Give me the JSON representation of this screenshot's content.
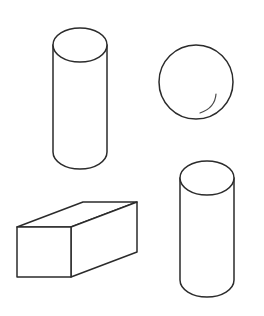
{
  "canvas": {
    "width": 264,
    "height": 316,
    "background_color": "#ffffff",
    "description": "Line drawing of four 3D geometric solids on a plain white background"
  },
  "style": {
    "stroke_color": "#2b2b2b",
    "stroke_width": 1.5,
    "fill_color": "#ffffff",
    "highlight_stroke_color": "#4a4a4a",
    "highlight_stroke_width": 1.2
  },
  "shapes": [
    {
      "id": "cylinder-upper-left",
      "name": "cylinder",
      "label": "Cylinder",
      "position": "upper-left",
      "geometry": {
        "center_x": 80,
        "top_ellipse_cy": 45,
        "bottom_ellipse_cy": 152,
        "radius_x": 27,
        "radius_y": 17,
        "height": 107
      }
    },
    {
      "id": "sphere-upper-right",
      "name": "sphere",
      "label": "Sphere",
      "position": "upper-right",
      "geometry": {
        "center_x": 196,
        "center_y": 82,
        "radius": 37
      },
      "highlight": {
        "name": "shine-arc",
        "start_x": 200,
        "start_y": 113,
        "control_x": 215,
        "control_y": 108,
        "end_x": 216,
        "end_y": 94
      }
    },
    {
      "id": "cylinder-lower-right",
      "name": "cylinder",
      "label": "Cylinder",
      "position": "lower-right",
      "geometry": {
        "center_x": 207,
        "top_ellipse_cy": 178,
        "bottom_ellipse_cy": 280,
        "radius_x": 27,
        "radius_y": 17,
        "height": 102
      }
    },
    {
      "id": "cuboid-lower-left",
      "name": "cuboid",
      "label": "Rectangular prism",
      "position": "lower-left",
      "geometry": {
        "front_left_x": 17,
        "front_right_x": 71,
        "front_top_y": 227,
        "front_bottom_y": 277,
        "depth_dx": 66,
        "depth_dy": -25
      },
      "vertices": {
        "front_top_left": [
          17,
          227
        ],
        "front_top_right": [
          71,
          227
        ],
        "front_bottom_right": [
          71,
          277
        ],
        "front_bottom_left": [
          17,
          277
        ],
        "back_top_left": [
          83,
          202
        ],
        "back_top_right": [
          137,
          202
        ],
        "back_bottom_right": [
          137,
          252
        ],
        "back_bottom_left": [
          83,
          252
        ]
      }
    }
  ]
}
